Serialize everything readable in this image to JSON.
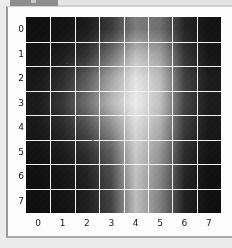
{
  "window": {
    "titlebar_visible": true,
    "titlebar_color": "#8d8d8d"
  },
  "figure": {
    "background_color": "#fdfdfd",
    "border_color": "#9d9d9d",
    "page_background_color": "#ececec"
  },
  "chart_data": {
    "type": "heatmap",
    "title": "",
    "subtitle": "",
    "xlabel": "",
    "ylabel": "",
    "colormap": "gray",
    "grid": true,
    "grid_color": "#f2f2f2",
    "legend": "none",
    "legend_position": "none",
    "annotations": [],
    "xlim": [
      -0.5,
      7.5
    ],
    "ylim": [
      7.5,
      -0.5
    ],
    "x": [
      0,
      1,
      2,
      3,
      4,
      5,
      6,
      7
    ],
    "y": [
      0,
      1,
      2,
      3,
      4,
      5,
      6,
      7
    ],
    "xticklabels": [
      "0",
      "1",
      "2",
      "3",
      "4",
      "5",
      "6",
      "7"
    ],
    "yticklabels": [
      "0",
      "1",
      "2",
      "3",
      "4",
      "5",
      "6",
      "7"
    ],
    "vmin": 0.0,
    "vmax": 1.0,
    "values": [
      [
        0.05,
        0.06,
        0.09,
        0.2,
        0.46,
        0.4,
        0.12,
        0.06
      ],
      [
        0.06,
        0.09,
        0.17,
        0.4,
        0.72,
        0.6,
        0.18,
        0.07
      ],
      [
        0.08,
        0.15,
        0.33,
        0.62,
        0.88,
        0.72,
        0.23,
        0.09
      ],
      [
        0.09,
        0.19,
        0.41,
        0.7,
        0.92,
        0.74,
        0.24,
        0.09
      ],
      [
        0.08,
        0.14,
        0.28,
        0.52,
        0.84,
        0.66,
        0.2,
        0.08
      ],
      [
        0.06,
        0.09,
        0.16,
        0.34,
        0.78,
        0.56,
        0.15,
        0.06
      ],
      [
        0.05,
        0.07,
        0.11,
        0.26,
        0.74,
        0.5,
        0.12,
        0.05
      ],
      [
        0.05,
        0.06,
        0.1,
        0.23,
        0.72,
        0.47,
        0.11,
        0.05
      ]
    ]
  }
}
